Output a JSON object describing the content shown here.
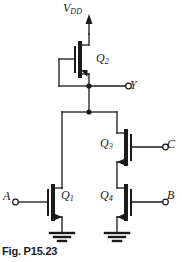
{
  "figure": {
    "caption": "Fig. P15.23",
    "type": "cmos-logic-gate-schematic"
  },
  "labels": {
    "vdd": "V",
    "vdd_sub": "DD",
    "q1": "Q",
    "q1_sub": "1",
    "q2": "Q",
    "q2_sub": "2",
    "q3": "Q",
    "q3_sub": "3",
    "q4": "Q",
    "q4_sub": "4",
    "output_y": "Y",
    "input_a": "A",
    "input_b": "B",
    "input_c": "C"
  },
  "colors": {
    "wire": "#1a1a1a",
    "background": "#ffffff",
    "text": "#1a1a1a"
  },
  "nodes": {
    "supply_rail": "V_DD",
    "output_node": "Y",
    "ground": "GND"
  },
  "devices": [
    {
      "name": "Q2",
      "type": "PMOS",
      "gate": "diode-connected-to-Y",
      "drain": "V_DD",
      "source": "Y"
    },
    {
      "name": "Q1",
      "type": "NMOS",
      "gate": "A",
      "drain": "Y",
      "source": "GND"
    },
    {
      "name": "Q3",
      "type": "NMOS",
      "gate": "C",
      "drain": "Y",
      "source": "Q4-drain"
    },
    {
      "name": "Q4",
      "type": "NMOS",
      "gate": "B",
      "drain": "Q3-source",
      "source": "GND"
    }
  ]
}
